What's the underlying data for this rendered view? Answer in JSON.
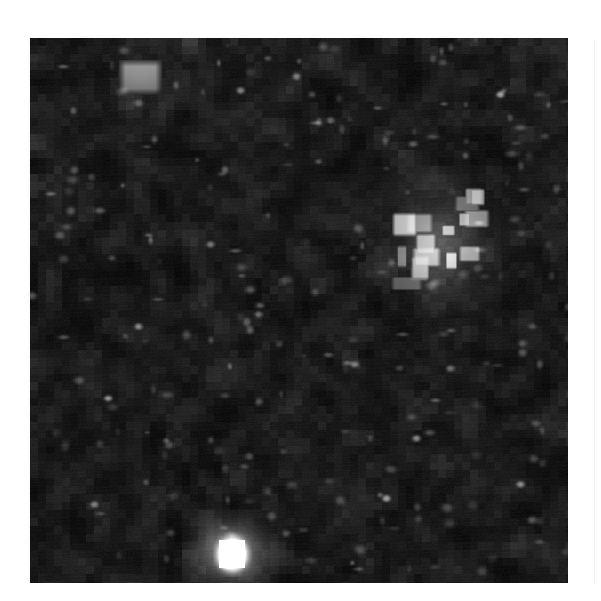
{
  "page": {
    "background_color": "#ffffff",
    "kind": "scanned-grayscale-figure",
    "caption": "",
    "axis_labels": [],
    "visible_text": []
  },
  "figure": {
    "name": "grayscale-image-plate",
    "x": 30,
    "y": 38,
    "width": 538,
    "height": 545,
    "background_color": "#050505",
    "colormap": "grayscale",
    "noise_seed": 20250711,
    "block_size": 8,
    "base_level": 10,
    "noise_amplitude": 26,
    "speckle_count": 210,
    "speckle_level": 120
  },
  "chart_data": {
    "type": "heatmap",
    "title": "",
    "subtitle": "",
    "xlabel": "",
    "ylabel": "",
    "grid": false,
    "legend": "none",
    "colorbar": false,
    "colormap": "grayscale",
    "value_range": [
      0,
      255
    ],
    "x_range": [
      0,
      538
    ],
    "y_range": [
      0,
      545
    ],
    "xtick_labels": [],
    "ytick_labels": [],
    "annotations": [],
    "background_field": {
      "description": "dense blocky compression-artifact noise, predominantly near-black",
      "mean_value": 14,
      "std_value": 12,
      "block_size_px": 8
    },
    "features": [
      {
        "name": "bright-rect-upper-left",
        "shape": "rectangle",
        "cx": 110,
        "cy": 39,
        "width": 42,
        "height": 34,
        "peak_value": 150,
        "edge_value": 40
      },
      {
        "name": "bright-cluster-upper-right",
        "shape": "blocky-cluster",
        "cx": 410,
        "cy": 202,
        "width": 84,
        "height": 104,
        "peak_value": 205,
        "edge_value": 55
      },
      {
        "name": "bright-core-bottom-center",
        "shape": "blob",
        "cx": 202,
        "cy": 516,
        "width": 38,
        "height": 44,
        "peak_value": 252,
        "edge_value": 70
      },
      {
        "name": "halo-bottom-center",
        "shape": "blob",
        "cx": 200,
        "cy": 514,
        "width": 96,
        "height": 86,
        "peak_value": 110,
        "edge_value": 18
      }
    ],
    "point_sources": [
      {
        "x": 210,
        "y": 52,
        "value": 96
      },
      {
        "x": 266,
        "y": 38,
        "value": 92
      },
      {
        "x": 300,
        "y": 82,
        "value": 78
      },
      {
        "x": 386,
        "y": 400,
        "value": 112
      },
      {
        "x": 470,
        "y": 56,
        "value": 130
      },
      {
        "x": 108,
        "y": 288,
        "value": 104
      },
      {
        "x": 228,
        "y": 276,
        "value": 86
      },
      {
        "x": 324,
        "y": 326,
        "value": 80
      },
      {
        "x": 64,
        "y": 466,
        "value": 90
      },
      {
        "x": 180,
        "y": 206,
        "value": 88
      },
      {
        "x": 490,
        "y": 446,
        "value": 104
      },
      {
        "x": 356,
        "y": 460,
        "value": 118
      },
      {
        "x": 78,
        "y": 360,
        "value": 82
      },
      {
        "x": 420,
        "y": 330,
        "value": 76
      }
    ]
  }
}
